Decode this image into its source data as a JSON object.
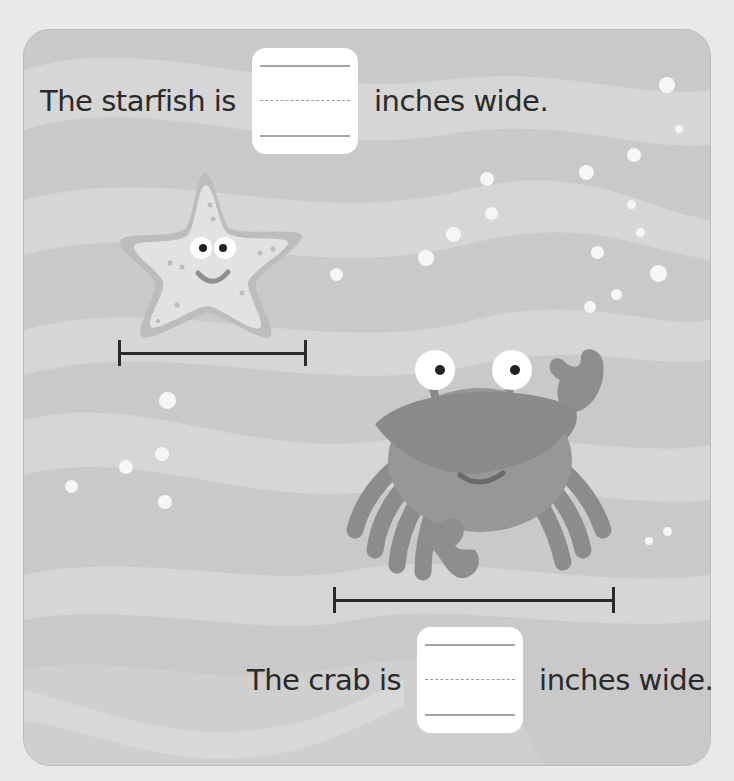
{
  "worksheet": {
    "starfish_question": {
      "prefix": "The starfish is",
      "suffix": "inches wide.",
      "answer_value": ""
    },
    "crab_question": {
      "prefix": "The crab is",
      "suffix": "inches wide.",
      "answer_value": ""
    },
    "illustrations": [
      {
        "subject": "starfish",
        "icon": "starfish-icon"
      },
      {
        "subject": "crab",
        "icon": "crab-icon"
      }
    ],
    "measure_lines": [
      {
        "for": "starfish",
        "icon": "measuring-line"
      },
      {
        "for": "crab",
        "icon": "measuring-line"
      }
    ]
  },
  "colors": {
    "page_background": "#e9e9e9",
    "panel_background": "#c9c9c9",
    "wave_light": "#d8d8d8",
    "bubble": "#f6f6f6",
    "text": "#2a2a2a",
    "answer_box": "#ffffff",
    "measure_line": "#2b2b2b"
  }
}
